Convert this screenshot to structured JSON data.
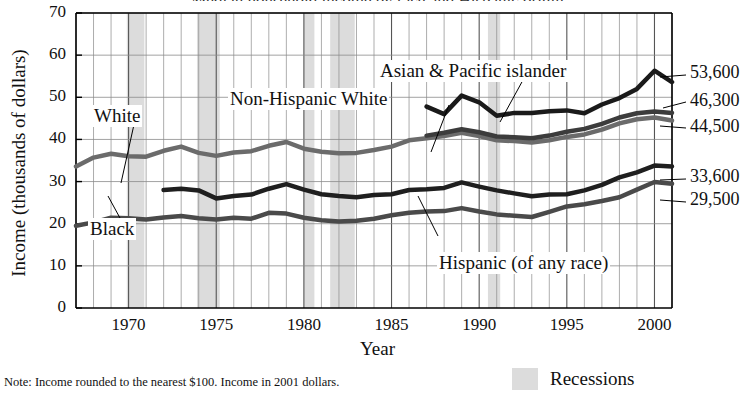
{
  "chart_data": {
    "type": "line",
    "title": "Median household income by race and Hispanic origin",
    "xlabel": "Year",
    "ylabel": "Income (thousands of dollars)",
    "ylim": [
      0,
      70
    ],
    "xlim": [
      1967,
      2001
    ],
    "yticks": [
      0,
      10,
      20,
      30,
      40,
      50,
      60,
      70
    ],
    "xticks": [
      1970,
      1975,
      1980,
      1985,
      1990,
      1995,
      2000
    ],
    "grid": true,
    "legend_position": "inline-labels",
    "units": "thousands of 2001 dollars",
    "x": [
      1967,
      1968,
      1969,
      1970,
      1971,
      1972,
      1973,
      1974,
      1975,
      1976,
      1977,
      1978,
      1979,
      1980,
      1981,
      1982,
      1983,
      1984,
      1985,
      1986,
      1987,
      1988,
      1989,
      1990,
      1991,
      1992,
      1993,
      1994,
      1995,
      1996,
      1997,
      1998,
      1999,
      2000,
      2001
    ],
    "series": [
      {
        "name": "White",
        "color": "#6b6b6b",
        "width": 4.5,
        "values": [
          33.6,
          35.7,
          36.6,
          36.0,
          35.9,
          37.3,
          38.3,
          36.8,
          36.1,
          36.9,
          37.2,
          38.5,
          39.4,
          37.8,
          37.1,
          36.7,
          36.8,
          37.5,
          38.3,
          39.8,
          40.3,
          40.8,
          41.6,
          40.8,
          39.8,
          39.6,
          39.3,
          39.8,
          40.6,
          41.2,
          42.3,
          43.8,
          44.8,
          45.2,
          44.5
        ]
      },
      {
        "name": "Non-Hispanic White",
        "color": "#3c3c3c",
        "width": 4.5,
        "values": [
          null,
          null,
          null,
          null,
          null,
          null,
          null,
          null,
          null,
          null,
          null,
          null,
          null,
          null,
          null,
          null,
          null,
          null,
          null,
          null,
          40.9,
          41.6,
          42.4,
          41.7,
          40.7,
          40.5,
          40.3,
          40.9,
          41.8,
          42.5,
          43.7,
          45.2,
          46.2,
          46.6,
          46.3
        ]
      },
      {
        "name": "Asian & Pacific islander",
        "color": "#1a1a1a",
        "width": 4.5,
        "values": [
          null,
          null,
          null,
          null,
          null,
          null,
          null,
          null,
          null,
          null,
          null,
          null,
          null,
          null,
          null,
          null,
          null,
          null,
          null,
          null,
          47.8,
          46.0,
          50.4,
          48.8,
          45.6,
          46.3,
          46.3,
          46.7,
          46.9,
          46.2,
          48.3,
          49.8,
          52.0,
          56.3,
          53.6
        ]
      },
      {
        "name": "Black",
        "color": "#4a4a4a",
        "width": 4.5,
        "values": [
          19.5,
          20.3,
          21.4,
          21.3,
          21.0,
          21.5,
          21.8,
          21.3,
          21.0,
          21.4,
          21.2,
          22.6,
          22.4,
          21.4,
          20.8,
          20.5,
          20.7,
          21.2,
          22.0,
          22.6,
          22.9,
          23.0,
          23.7,
          22.9,
          22.2,
          21.9,
          21.6,
          22.8,
          24.1,
          24.6,
          25.4,
          26.3,
          28.1,
          29.9,
          29.5
        ]
      },
      {
        "name": "Hispanic (of any race)",
        "color": "#1f1f1f",
        "width": 4.5,
        "values": [
          null,
          null,
          null,
          null,
          null,
          28.0,
          28.3,
          27.9,
          26.0,
          26.6,
          26.9,
          28.3,
          29.4,
          28.1,
          27.0,
          26.6,
          26.3,
          26.8,
          27.0,
          28.0,
          28.2,
          28.5,
          29.8,
          28.8,
          27.9,
          27.2,
          26.5,
          26.9,
          27.0,
          27.9,
          29.2,
          31.0,
          32.2,
          33.8,
          33.6
        ]
      }
    ],
    "end_labels": [
      {
        "value": "53,600",
        "series": "Asian & Pacific islander"
      },
      {
        "value": "46,300",
        "series": "Non-Hispanic White"
      },
      {
        "value": "44,500",
        "series": "White"
      },
      {
        "value": "33,600",
        "series": "Hispanic (of any race)"
      },
      {
        "value": "29,500",
        "series": "Black"
      }
    ],
    "recessions": [
      {
        "start": 1969.9,
        "end": 1970.9
      },
      {
        "start": 1973.9,
        "end": 1975.2
      },
      {
        "start": 1980.0,
        "end": 1980.6
      },
      {
        "start": 1981.5,
        "end": 1982.9
      },
      {
        "start": 1990.5,
        "end": 1991.2
      }
    ],
    "recession_color": "#dcdcdc",
    "annotations": {
      "white": "White",
      "non_hispanic_white": "Non-Hispanic White",
      "asian": "Asian & Pacific islander",
      "black": "Black",
      "hispanic": "Hispanic (of any race)"
    },
    "note": "Note: Income rounded to the nearest $100. Income in 2001 dollars.",
    "legend_label": "Recessions"
  }
}
